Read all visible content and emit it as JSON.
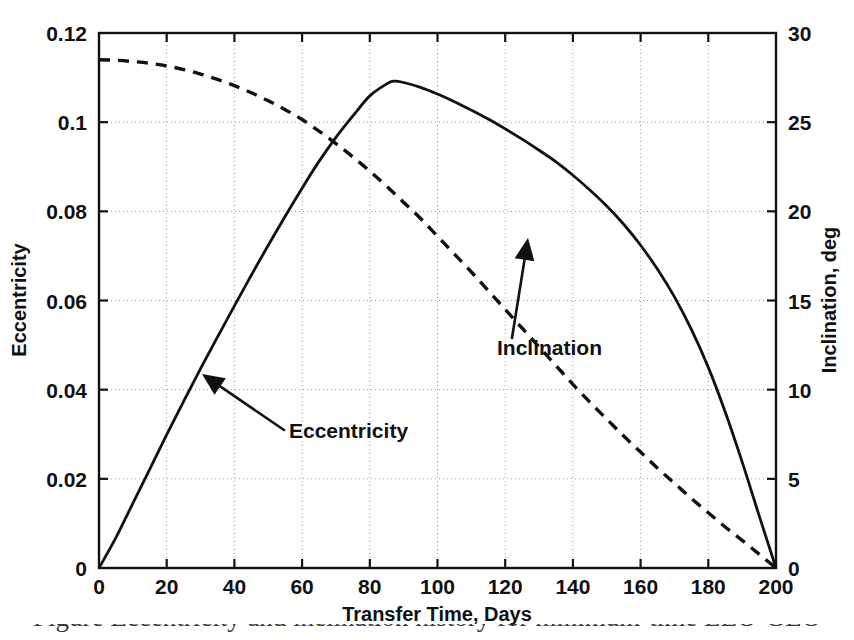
{
  "chart_data": {
    "type": "line",
    "title": "",
    "xlabel": "Transfer Time, Days",
    "ylabel": "Eccentricity",
    "y2label": "Inclination, deg",
    "xlim": [
      0,
      200
    ],
    "ylim": [
      0,
      0.12
    ],
    "y2lim": [
      0,
      30
    ],
    "grid": true,
    "legend_position": "inline-annotations",
    "xticks": [
      "0",
      "20",
      "40",
      "60",
      "80",
      "100",
      "120",
      "140",
      "160",
      "180",
      "200"
    ],
    "xtick_values": [
      0,
      20,
      40,
      60,
      80,
      100,
      120,
      140,
      160,
      180,
      200
    ],
    "yticks": [
      "0",
      "0.02",
      "0.04",
      "0.06",
      "0.08",
      "0.1",
      "0.12"
    ],
    "ytick_values": [
      0,
      0.02,
      0.04,
      0.06,
      0.08,
      0.1,
      0.12
    ],
    "y2ticks": [
      "0",
      "5",
      "10",
      "15",
      "20",
      "25",
      "30"
    ],
    "y2tick_values": [
      0,
      5,
      10,
      15,
      20,
      25,
      30
    ],
    "series": [
      {
        "name": "Eccentricity",
        "axis": "left",
        "style": "solid",
        "color": "#111111",
        "x": [
          0,
          5,
          10,
          15,
          20,
          25,
          30,
          35,
          40,
          45,
          50,
          55,
          60,
          65,
          70,
          75,
          80,
          85,
          87,
          90,
          95,
          100,
          105,
          110,
          115,
          120,
          125,
          130,
          135,
          140,
          145,
          150,
          155,
          160,
          165,
          170,
          175,
          180,
          185,
          190,
          195,
          200
        ],
        "y": [
          0,
          0.0068,
          0.0145,
          0.0222,
          0.0299,
          0.0374,
          0.0447,
          0.0518,
          0.0588,
          0.0657,
          0.0724,
          0.0789,
          0.0852,
          0.0912,
          0.0966,
          0.1014,
          0.1059,
          0.1086,
          0.1092,
          0.1089,
          0.1078,
          0.1063,
          0.1046,
          0.1027,
          0.1007,
          0.0985,
          0.0962,
          0.0937,
          0.0911,
          0.0881,
          0.0848,
          0.0812,
          0.0771,
          0.0724,
          0.067,
          0.0608,
          0.0535,
          0.045,
          0.035,
          0.0238,
          0.0118,
          0
        ]
      },
      {
        "name": "Inclination",
        "axis": "right",
        "style": "dashed",
        "color": "#111111",
        "x": [
          0,
          5,
          10,
          15,
          20,
          25,
          30,
          35,
          40,
          45,
          50,
          55,
          60,
          65,
          70,
          75,
          80,
          85,
          90,
          95,
          100,
          105,
          110,
          115,
          120,
          125,
          130,
          135,
          140,
          145,
          150,
          155,
          160,
          165,
          170,
          175,
          180,
          185,
          190,
          195,
          200
        ],
        "y": [
          28.5,
          28.47,
          28.4,
          28.3,
          28.15,
          27.95,
          27.7,
          27.4,
          27.05,
          26.65,
          26.2,
          25.7,
          25.15,
          24.5,
          23.8,
          23.05,
          22.25,
          21.4,
          20.5,
          19.6,
          18.6,
          17.6,
          16.6,
          15.55,
          14.5,
          13.45,
          12.4,
          11.35,
          10.3,
          9.3,
          8.35,
          7.4,
          6.5,
          5.6,
          4.75,
          3.9,
          3.1,
          2.3,
          1.55,
          0.78,
          0
        ]
      }
    ],
    "annotations": [
      {
        "text": "Eccentricity",
        "target_x": 31,
        "target_y_left": 0.0465,
        "arrow_tip": [
          202,
          374
        ],
        "arrow_tail": [
          284,
          430
        ],
        "label_x": 289,
        "label_y": 438,
        "arrow_direction": "up-left"
      },
      {
        "text": "Inclination",
        "target_x": 126,
        "target_y_right": 18.9,
        "arrow_tip": [
          528,
          238
        ],
        "arrow_tail": [
          512,
          338
        ],
        "label_x": 497,
        "label_y": 355,
        "arrow_direction": "up-right"
      }
    ]
  },
  "figure": {
    "plot_area": {
      "left": 99,
      "top": 33,
      "right": 776,
      "bottom": 568
    },
    "colors": {
      "axis": "#111111",
      "grid": "#9a9a9a",
      "background": "#ffffff",
      "curve": "#111111"
    }
  },
  "caption": {
    "partial_text": "Figure  Eccentricity and inclination history for minimum-time LEO-GEO"
  }
}
